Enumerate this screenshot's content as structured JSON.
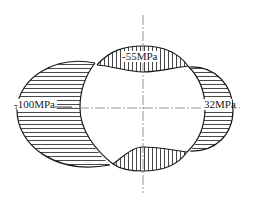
{
  "diagram": {
    "type": "stress-distribution",
    "labels": {
      "top": "-55MPa",
      "left": "-100MPa",
      "right": "32MPa"
    },
    "colors": {
      "line": "#1a1a1a",
      "axis": "#7a7a7a",
      "background": "#ffffff"
    }
  }
}
